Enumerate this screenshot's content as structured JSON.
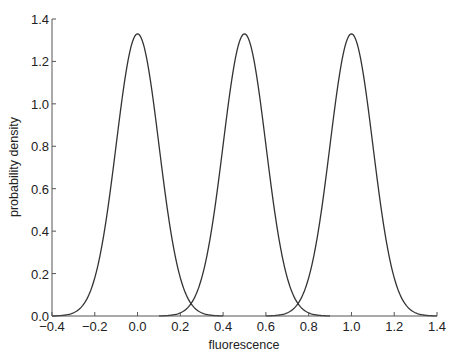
{
  "chart_data": {
    "type": "line",
    "title": "",
    "xlabel": "fluorescence",
    "ylabel": "probability density",
    "xlim": [
      -0.4,
      1.4
    ],
    "ylim": [
      0.0,
      1.4
    ],
    "grid": false,
    "legend": null,
    "x_ticks": [
      "-0.4",
      "-0.2",
      "0.0",
      "0.2",
      "0.4",
      "0.6",
      "0.8",
      "1.0",
      "1.2",
      "1.4"
    ],
    "y_ticks": [
      "0.0",
      "0.2",
      "0.4",
      "0.6",
      "0.8",
      "1.0",
      "1.2",
      "1.4"
    ],
    "series": [
      {
        "name": "peak at 0.0",
        "center": 0.0,
        "sigma": 0.1,
        "peak": 1.33,
        "x_range": [
          -0.4,
          0.4
        ]
      },
      {
        "name": "peak at 0.5",
        "center": 0.5,
        "sigma": 0.1,
        "peak": 1.33,
        "x_range": [
          0.1,
          0.9
        ]
      },
      {
        "name": "peak at 1.0",
        "center": 1.0,
        "sigma": 0.1,
        "peak": 1.33,
        "x_range": [
          0.6,
          1.4
        ]
      }
    ],
    "line_color": "#333333"
  }
}
